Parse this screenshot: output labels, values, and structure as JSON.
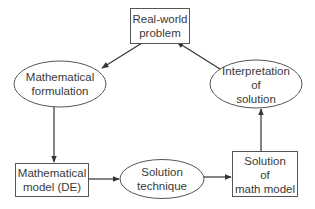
{
  "diagram": {
    "type": "flowchart-cycle",
    "nodes": {
      "real_world": {
        "shape": "rect",
        "lines": [
          "Real-world",
          "problem"
        ]
      },
      "formulation": {
        "shape": "ellipse",
        "lines": [
          "Mathematical",
          "formulation"
        ]
      },
      "model": {
        "shape": "rect",
        "lines": [
          "Mathematical",
          "model (DE)"
        ]
      },
      "technique": {
        "shape": "ellipse",
        "lines": [
          "Solution",
          "technique"
        ]
      },
      "solution": {
        "shape": "rect",
        "lines": [
          "Solution",
          "of",
          "math model"
        ]
      },
      "interpretation": {
        "shape": "ellipse",
        "lines": [
          "Interpretation",
          "of",
          "solution"
        ]
      }
    },
    "edges": [
      {
        "from": "real_world",
        "to": "formulation"
      },
      {
        "from": "formulation",
        "to": "model"
      },
      {
        "from": "model",
        "to": "technique"
      },
      {
        "from": "technique",
        "to": "solution"
      },
      {
        "from": "solution",
        "to": "interpretation"
      },
      {
        "from": "interpretation",
        "to": "real_world"
      }
    ],
    "colors": {
      "stroke": "#555555",
      "text": "#3a3a3a",
      "background": "#ffffff"
    }
  }
}
